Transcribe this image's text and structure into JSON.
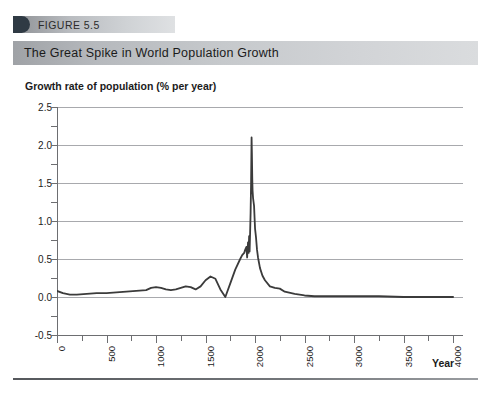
{
  "figure": {
    "tag_label": "FIGURE 5.5",
    "banner_title": "The Great Spike in World Population Growth",
    "tag_accent_color": "#2f3a44",
    "banner_color": "#c6c9cc"
  },
  "chart_data": {
    "type": "line",
    "title": "The Great Spike in World Population Growth",
    "subtitle": "FIGURE 5.5",
    "xlabel": "Year",
    "ylabel": "Growth rate of population (% per year)",
    "xlim": [
      0,
      4100
    ],
    "ylim": [
      -0.5,
      2.5
    ],
    "xticks": [
      0,
      500,
      1000,
      1500,
      2000,
      2500,
      3000,
      3500,
      4000
    ],
    "xtick_labels": [
      "0",
      "500",
      "1000",
      "1500",
      "2000",
      "2500",
      "3000",
      "3500",
      "4000"
    ],
    "x_minor_tick_step": 250,
    "yticks": [
      -0.5,
      0.0,
      0.5,
      1.0,
      1.5,
      2.0,
      2.5
    ],
    "ytick_labels": [
      "-0.5",
      "0.0",
      "0.5",
      "1.0",
      "1.5",
      "2.0",
      "2.5"
    ],
    "y_minor_tick_step": 0.25,
    "grid": "horizontal",
    "legend": "none",
    "line_color": "#3b3b3b",
    "peak_value": 2.1,
    "peak_year": 1965,
    "series": [
      {
        "name": "World population growth rate",
        "x": [
          0,
          60,
          130,
          200,
          300,
          400,
          500,
          600,
          700,
          800,
          900,
          950,
          1000,
          1050,
          1100,
          1150,
          1200,
          1250,
          1300,
          1350,
          1400,
          1450,
          1500,
          1550,
          1600,
          1650,
          1700,
          1750,
          1800,
          1850,
          1870,
          1890,
          1900,
          1913,
          1920,
          1929,
          1935,
          1940,
          1945,
          1950,
          1955,
          1960,
          1965,
          1968,
          1972,
          1975,
          1980,
          1985,
          1990,
          1995,
          2000,
          2010,
          2020,
          2030,
          2050,
          2075,
          2100,
          2150,
          2200,
          2250,
          2300,
          2400,
          2500,
          2600,
          2800,
          3000,
          3250,
          3500,
          3750,
          4000
        ],
        "y": [
          0.08,
          0.05,
          0.03,
          0.03,
          0.04,
          0.05,
          0.05,
          0.06,
          0.07,
          0.08,
          0.09,
          0.12,
          0.13,
          0.12,
          0.1,
          0.09,
          0.1,
          0.12,
          0.14,
          0.13,
          0.1,
          0.14,
          0.22,
          0.27,
          0.24,
          0.1,
          0.0,
          0.18,
          0.36,
          0.5,
          0.55,
          0.58,
          0.62,
          0.66,
          0.52,
          0.72,
          0.58,
          0.8,
          0.6,
          0.84,
          1.1,
          1.5,
          2.1,
          1.9,
          1.55,
          1.4,
          1.3,
          1.25,
          1.2,
          1.05,
          0.9,
          0.78,
          0.62,
          0.52,
          0.38,
          0.28,
          0.22,
          0.14,
          0.12,
          0.11,
          0.07,
          0.04,
          0.02,
          0.01,
          0.01,
          0.01,
          0.01,
          0.0,
          0.0,
          0.0
        ]
      }
    ],
    "annotations": []
  }
}
